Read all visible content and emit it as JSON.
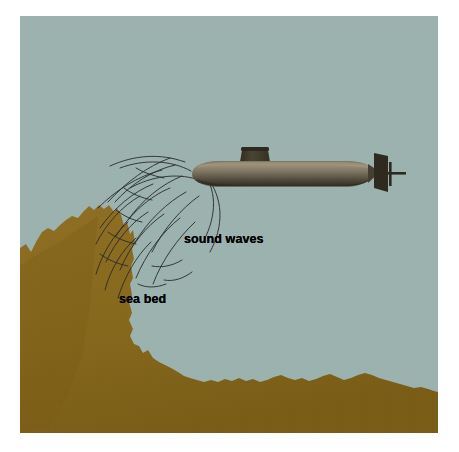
{
  "figure": {
    "colors": {
      "page_background": "#ffffff",
      "water": "#9db3b0",
      "sea_bed": "#8a6b1e",
      "sea_bed_shadow": "#795d18",
      "submarine_hull_light": "#9a8e78",
      "submarine_hull_mid": "#6d6453",
      "submarine_hull_dark": "#3b3428",
      "conning_tower": "#3f3a2c",
      "wave_line": "#2b2f31",
      "label_text": "#000000"
    },
    "canvas": {
      "width": 459,
      "height": 452,
      "scene_left": 20,
      "scene_top": 16,
      "scene_width": 418,
      "scene_height": 417
    }
  },
  "labels": [
    {
      "id": "sound-waves",
      "text": "sound waves",
      "x": 164,
      "y": 216
    },
    {
      "id": "sea-bed",
      "text": "sea bed",
      "x": 99,
      "y": 276
    }
  ],
  "objects": {
    "submarine": {
      "name": "submarine",
      "bow_x": 170,
      "stern_x": 355,
      "center_y": 158,
      "hull_length": 185,
      "hull_height": 22,
      "conning_tower": {
        "x": 222,
        "y": 133,
        "width": 26,
        "height": 17
      },
      "rudder": {
        "x": 356,
        "y": 135,
        "width": 14,
        "height": 34
      },
      "propeller_shaft": {
        "x": 368,
        "y": 158,
        "length": 18
      }
    },
    "sea_bed": {
      "name": "sea-bed",
      "peak_x": 72,
      "peak_y": 205,
      "base_y": 417,
      "note": "jagged ochre rock massif on left descending to a low flat sea floor on the right"
    },
    "sound_waves": {
      "name": "sound-waves",
      "arc_count": 14,
      "origin_x": 175,
      "origin_y": 165,
      "direction": "radiating down-left from submarine bow toward sea bed peak"
    }
  }
}
